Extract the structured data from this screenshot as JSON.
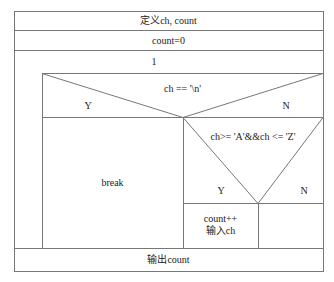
{
  "diagram": {
    "type": "nassi-shneiderman",
    "rows": {
      "declare": "定义ch, count",
      "init": "count=0",
      "loop_condition": "1",
      "output": "输出count"
    },
    "outer_if": {
      "condition": "ch == '\\n'",
      "yes_label": "Y",
      "no_label": "N",
      "yes_body": "break"
    },
    "inner_if": {
      "condition": "ch>= 'A'&&ch <= 'Z'",
      "yes_label": "Y",
      "no_label": "N",
      "yes_body_line1": "count++",
      "yes_body_line2": "输入ch",
      "no_body": ""
    },
    "colors": {
      "line": "#777777",
      "background": "#ffffff",
      "text": "#222222"
    }
  }
}
